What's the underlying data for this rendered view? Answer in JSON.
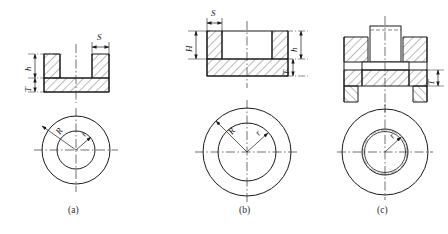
{
  "figure": {
    "kind": "engineering-drawing",
    "background_color": "#ffffff",
    "line_color": "#1a1a1a",
    "hatch_color": "#3a3a3a",
    "centerline_color": "#333333",
    "panels": [
      {
        "id": "a",
        "caption": "(a)",
        "section_title": "cup-recess-section",
        "dimensions": [
          {
            "name": "S",
            "label": "S",
            "position": "top-right",
            "meaning": "wall-thickness"
          },
          {
            "name": "h",
            "label": "h",
            "position": "left-upper",
            "meaning": "recess-depth"
          },
          {
            "name": "T",
            "label": "T",
            "position": "left-lower",
            "meaning": "base-thickness"
          }
        ],
        "plan_view": {
          "circles": 2,
          "labels": [
            {
              "name": "R",
              "label": "R",
              "meaning": "outer-radius"
            },
            {
              "name": "r",
              "label": "r",
              "meaning": "inner-radius"
            }
          ]
        }
      },
      {
        "id": "b",
        "caption": "(b)",
        "section_title": "wide-flange-section",
        "dimensions": [
          {
            "name": "S",
            "label": "S",
            "position": "top-left",
            "meaning": "wall-thickness"
          },
          {
            "name": "H",
            "label": "H",
            "position": "left",
            "meaning": "wall-height"
          },
          {
            "name": "h",
            "label": "h",
            "position": "right-upper",
            "meaning": "recess-depth"
          },
          {
            "name": "T",
            "label": "T",
            "position": "right-lower",
            "meaning": "base-thickness"
          }
        ],
        "plan_view": {
          "circles": 2,
          "labels": [
            {
              "name": "R",
              "label": "R",
              "meaning": "outer-radius"
            },
            {
              "name": "r",
              "label": "r",
              "meaning": "inner-radius"
            }
          ]
        }
      },
      {
        "id": "c",
        "caption": "(c)",
        "section_title": "boss-in-bore-assembly-section",
        "dimensions": [
          {
            "name": "T",
            "label": "T",
            "position": "right",
            "meaning": "plate-thickness"
          }
        ],
        "plan_view": {
          "circles": 3,
          "labels": [
            {
              "name": "r",
              "label": "r",
              "meaning": "bore-radius"
            }
          ]
        }
      }
    ]
  }
}
